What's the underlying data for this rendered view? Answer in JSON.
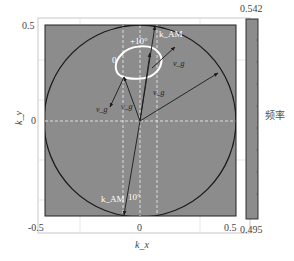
{
  "figure": {
    "y_axis": {
      "label": "k_y",
      "ticks": [
        "0.5",
        "0"
      ]
    },
    "x_axis": {
      "label": "k_x",
      "ticks": [
        "-0.5",
        "0",
        "0.5"
      ]
    },
    "colorbar": {
      "max_label": "0.542",
      "min_label": "0.495",
      "title": "频率",
      "color": "#8c8c8c"
    },
    "annotations": {
      "angle_top": "+10°",
      "angle_bottom": "10°",
      "zero_label": "0",
      "k_top": "k_AM",
      "k_bottom": "k_AM",
      "vg_left": "v_g",
      "vg_mid": "v_g",
      "vg_center": "v_g",
      "vg_right": "v_g"
    },
    "colors": {
      "field": "#8c8c8c",
      "circle": "#1a1a1a",
      "contour": "#ffffff",
      "dashed": "#e8e8e8",
      "arrow": "#1a1a1a"
    }
  }
}
